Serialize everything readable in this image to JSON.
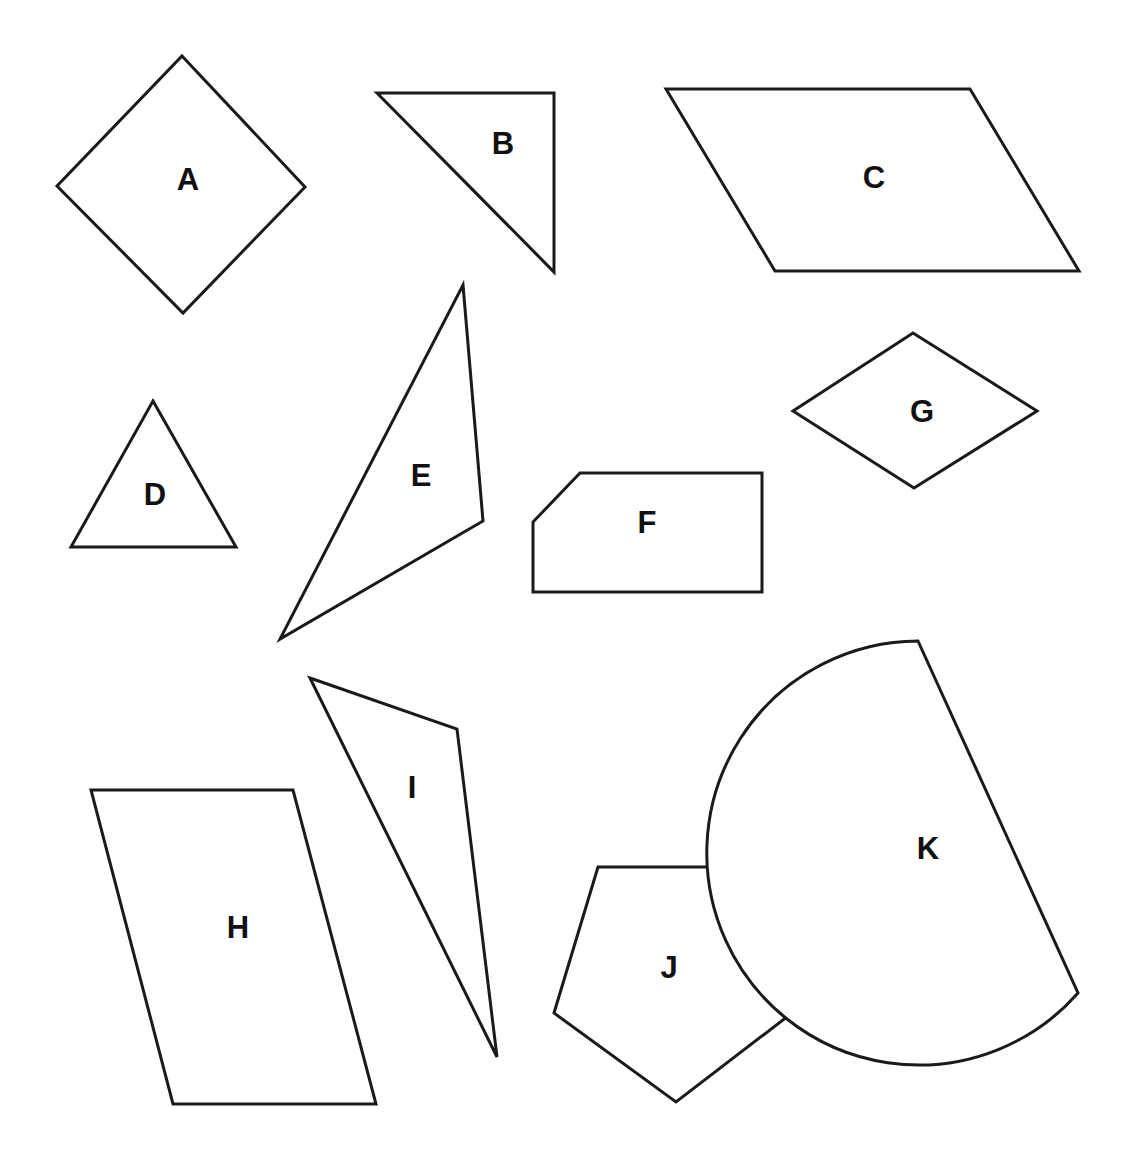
{
  "canvas": {
    "width": 1141,
    "height": 1161,
    "background_color": "#ffffff",
    "stroke_color": "#1a1a1a",
    "label_color": "#111111",
    "stroke_width": 3
  },
  "figure": {
    "type": "geometry-shape-sheet",
    "shape_count": 11,
    "labels": [
      "A",
      "B",
      "C",
      "D",
      "E",
      "F",
      "G",
      "H",
      "I",
      "J",
      "K"
    ]
  },
  "shapes": [
    {
      "label": "A",
      "kind": "rhombus",
      "geometry": "polygon",
      "points": "182,56 305,187 183,313 57,186",
      "label_x": 188,
      "label_y": 182
    },
    {
      "label": "B",
      "kind": "right-triangle",
      "geometry": "polygon",
      "points": "377,93 554,93 554,272",
      "label_x": 503,
      "label_y": 146
    },
    {
      "label": "C",
      "kind": "parallelogram",
      "geometry": "polygon",
      "points": "666,89 970,89 1079,271 775,271",
      "label_x": 874,
      "label_y": 180
    },
    {
      "label": "D",
      "kind": "triangle",
      "geometry": "polygon",
      "points": "153,401 236,547 71,547",
      "label_x": 155,
      "label_y": 497
    },
    {
      "label": "E",
      "kind": "scalene-triangle",
      "geometry": "polygon",
      "points": "463,285 483,521 280,639",
      "label_x": 421,
      "label_y": 478
    },
    {
      "label": "F",
      "kind": "clipped-rectangle-pentagon",
      "geometry": "polygon",
      "points": "580,473 762,473 762,592 533,592 533,522",
      "label_x": 647,
      "label_y": 525
    },
    {
      "label": "G",
      "kind": "wide-rhombus",
      "geometry": "polygon",
      "points": "913,333 1037,411 914,488 793,411",
      "label_x": 922,
      "label_y": 414
    },
    {
      "label": "H",
      "kind": "parallelogram",
      "geometry": "polygon",
      "points": "91,790 293,790 376,1104 173,1104",
      "label_x": 238,
      "label_y": 930
    },
    {
      "label": "I",
      "kind": "thin-triangle",
      "geometry": "polygon",
      "points": "310,678 457,729 497,1057",
      "label_x": 412,
      "label_y": 790
    },
    {
      "label": "J",
      "kind": "pentagon",
      "geometry": "polygon",
      "points": "598,867 748,867 792,1013 676,1102 554,1013",
      "label_x": 669,
      "label_y": 970
    },
    {
      "label": "K",
      "kind": "half-disc-sector",
      "geometry": "path",
      "path": "M 918 641 L 1078 993 A 212 212 0 1 1 918 641 Z",
      "label_x": 928,
      "label_y": 851
    }
  ]
}
